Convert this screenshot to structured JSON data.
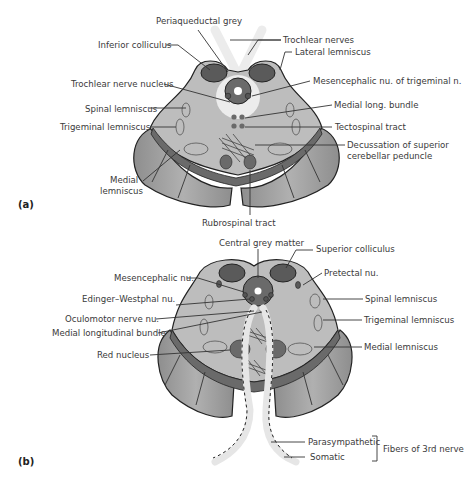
{
  "figure": {
    "panels": [
      {
        "id": "a",
        "panel_label": "(a)",
        "labels": {
          "periaqueductal_grey": "Periaqueductal grey",
          "inferior_colliculus": "Inferior colliculus",
          "trochlear_nerves": "Trochlear nerves",
          "lateral_lemniscus": "Lateral lemniscus",
          "trochlear_nerve_nucleus": "Trochlear nerve nucleus",
          "mesencephalic_nu_trigeminal": "Mesencephalic nu. of trigeminal n.",
          "spinal_lemniscus": "Spinal lemniscus",
          "medial_long_bundle": "Medial long. bundle",
          "trigeminal_lemniscus": "Trigeminal lemniscus",
          "tectospinal_tract": "Tectospinal tract",
          "decussation_line1": "Decussation of superior",
          "decussation_line2": "cerebellar peduncle",
          "medial_lemniscus_line1": "Medial",
          "medial_lemniscus_line2": "lemniscus",
          "rubrospinal_tract": "Rubrospinal tract"
        }
      },
      {
        "id": "b",
        "panel_label": "(b)",
        "labels": {
          "central_grey_matter": "Central grey matter",
          "superior_colliculus": "Superior colliculus",
          "mesencephalic_nu": "Mesencephalic nu.",
          "pretectal_nu": "Pretectal nu.",
          "edinger_westphal_nu": "Edinger–Westphal nu.",
          "spinal_lemniscus": "Spinal lemniscus",
          "oculomotor_nerve_nu": "Oculomotor nerve nu.",
          "trigeminal_lemniscus": "Trigeminal lemniscus",
          "medial_longitudinal_bundle": "Medial longitudinal bundle",
          "red_nucleus": "Red nucleus",
          "medial_lemniscus": "Medial lemniscus",
          "parasympathetic": "Parasympathetic",
          "somatic": "Somatic",
          "fibers_of_3rd_nerve": "Fibers of 3rd nerve"
        }
      }
    ],
    "colors": {
      "tegmentum": "#b9b9b9",
      "peduncle": "#9a9a9a",
      "dark_nucleus": "#5a5a5a",
      "substantia_nigra": "#6e6e6e",
      "nerve_fiber": "#e6e6e6",
      "outline": "#222222"
    }
  }
}
